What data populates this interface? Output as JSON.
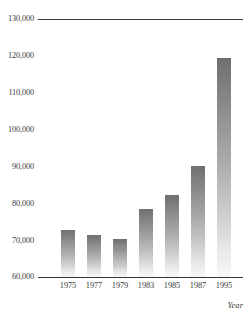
{
  "chart_data": {
    "type": "bar",
    "title": "",
    "xlabel": "Year",
    "ylabel": "",
    "categories": [
      "1975",
      "1977",
      "1979",
      "1983",
      "1985",
      "1987",
      "1995"
    ],
    "values": [
      72800,
      71500,
      70200,
      78500,
      82300,
      90100,
      119400
    ],
    "ylim": [
      60000,
      130000
    ],
    "yticks": [
      60000,
      70000,
      80000,
      90000,
      100000,
      110000,
      120000,
      130000
    ],
    "ytick_labels": [
      "60,000",
      "70,000",
      "80,000",
      "90,000",
      "100,000",
      "110,000",
      "120,000",
      "130,000"
    ],
    "grid": false,
    "legend": null,
    "series": [
      {
        "name": "",
        "values": [
          72800,
          71500,
          70200,
          78500,
          82300,
          90100,
          119400
        ]
      }
    ],
    "bar_color_top": "#6f6f6f",
    "bar_color_bottom": "#f7f7f7",
    "axis_color": "#333333",
    "background": "#ffffff"
  },
  "axes": {
    "y_ticks": [
      {
        "label": "130,000",
        "value": 130000
      },
      {
        "label": "120,000",
        "value": 120000
      },
      {
        "label": "110,000",
        "value": 110000
      },
      {
        "label": "100,000",
        "value": 100000
      },
      {
        "label": "90,000",
        "value": 90000
      },
      {
        "label": "80,000",
        "value": 80000
      },
      {
        "label": "70,000",
        "value": 70000
      },
      {
        "label": "60,000",
        "value": 60000
      }
    ],
    "x_ticks": [
      {
        "label": "1975",
        "value": 72800
      },
      {
        "label": "1977",
        "value": 71500
      },
      {
        "label": "1979",
        "value": 70200
      },
      {
        "label": "1983",
        "value": 78500
      },
      {
        "label": "1985",
        "value": 82300
      },
      {
        "label": "1987",
        "value": 90100
      },
      {
        "label": "1995",
        "value": 119400
      }
    ],
    "x_axis_title": "Year"
  }
}
